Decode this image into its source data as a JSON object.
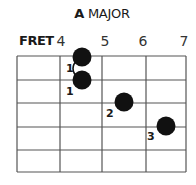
{
  "title": {
    "root": "A",
    "quality": "MAJOR"
  },
  "fret_header": {
    "label": "FRET",
    "frets": [
      {
        "label": "4",
        "x": 61
      },
      {
        "label": "5",
        "x": 105
      },
      {
        "label": "6",
        "x": 143
      },
      {
        "label": "7",
        "x": 184
      }
    ]
  },
  "grid": {
    "strings": 6,
    "fret_columns": 4,
    "line_color": "#555555",
    "string_y": [
      56,
      80,
      103,
      127,
      150,
      172
    ],
    "fret_x": [
      17,
      60,
      102,
      146,
      186
    ]
  },
  "dots": [
    {
      "cx": 82,
      "cy": 57,
      "finger": "1",
      "label_x": 66,
      "label_y": 72
    },
    {
      "cx": 82,
      "cy": 80,
      "finger": "1",
      "label_x": 66,
      "label_y": 95
    },
    {
      "cx": 124,
      "cy": 102,
      "finger": "2",
      "label_x": 106,
      "label_y": 117
    },
    {
      "cx": 166,
      "cy": 126,
      "finger": "3",
      "label_x": 147,
      "label_y": 140
    }
  ],
  "barre": {
    "from_dot": 0,
    "to_dot": 1
  },
  "colors": {
    "dot": "#111111",
    "text": "#1a1a1a"
  }
}
